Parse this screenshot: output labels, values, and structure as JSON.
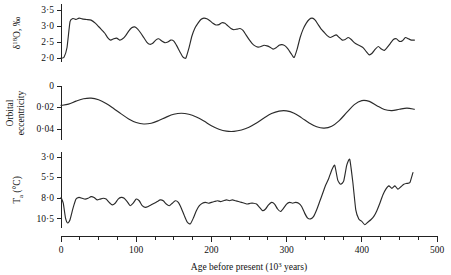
{
  "chart_data": {
    "type": "line",
    "title": "",
    "xlabel": "Age before present (10³ years)",
    "xlim": [
      0,
      500
    ],
    "xticks": [
      0,
      100,
      200,
      300,
      400,
      500
    ],
    "xtick_labels": [
      "0",
      "100",
      "200",
      "300",
      "400",
      "500"
    ],
    "xminor_step": 25,
    "grid": false,
    "legend": "none",
    "panels": [
      {
        "name": "delta-o18",
        "ylabel": "δ¹⁸O, ‰",
        "ylabel_parts": {
          "delta": "δ",
          "sup": "18",
          "rest": "O, ‰"
        },
        "ylim": [
          3.7,
          1.9
        ],
        "inverted": true,
        "yticks": [
          2.0,
          2.5,
          3.0,
          3.5
        ],
        "ytick_labels": [
          "2·0",
          "2·5",
          "3·0",
          "3·5"
        ],
        "x": [
          0,
          4,
          8,
          12,
          16,
          20,
          24,
          28,
          34,
          40,
          46,
          52,
          58,
          62,
          66,
          70,
          74,
          78,
          82,
          86,
          90,
          94,
          98,
          102,
          106,
          110,
          114,
          118,
          122,
          126,
          130,
          134,
          138,
          142,
          146,
          150,
          154,
          158,
          162,
          166,
          170,
          174,
          178,
          182,
          186,
          190,
          194,
          198,
          202,
          206,
          210,
          214,
          218,
          222,
          226,
          230,
          234,
          238,
          242,
          246,
          250,
          254,
          258,
          262,
          266,
          270,
          274,
          278,
          282,
          286,
          290,
          294,
          298,
          302,
          306,
          310,
          314,
          318,
          322,
          326,
          330,
          334,
          338,
          342,
          346,
          350,
          354,
          358,
          362,
          366,
          370,
          374,
          378,
          382,
          386,
          390,
          394,
          398,
          402,
          406,
          410,
          414,
          418,
          422,
          426,
          430,
          434,
          438,
          442,
          446,
          450,
          454,
          458,
          462,
          466,
          470
        ],
        "y": [
          2.02,
          2.05,
          2.35,
          3.15,
          3.25,
          3.22,
          3.26,
          3.24,
          3.22,
          3.2,
          3.1,
          2.95,
          2.8,
          2.66,
          2.58,
          2.62,
          2.64,
          2.58,
          2.62,
          2.72,
          2.86,
          2.96,
          2.99,
          2.92,
          2.8,
          2.66,
          2.52,
          2.45,
          2.48,
          2.58,
          2.62,
          2.55,
          2.5,
          2.52,
          2.58,
          2.55,
          2.4,
          2.22,
          2.06,
          2.02,
          2.32,
          2.7,
          2.95,
          3.1,
          3.22,
          3.26,
          3.24,
          3.18,
          3.1,
          3.05,
          3.06,
          3.12,
          3.1,
          3.02,
          2.94,
          2.9,
          2.92,
          2.94,
          2.88,
          2.74,
          2.6,
          2.48,
          2.4,
          2.36,
          2.38,
          2.42,
          2.4,
          2.36,
          2.3,
          2.34,
          2.42,
          2.44,
          2.4,
          2.3,
          2.16,
          2.04,
          2.3,
          2.66,
          2.92,
          3.1,
          3.22,
          3.26,
          3.2,
          3.06,
          2.92,
          2.82,
          2.72,
          2.66,
          2.7,
          2.74,
          2.66,
          2.58,
          2.6,
          2.66,
          2.6,
          2.5,
          2.44,
          2.4,
          2.34,
          2.22,
          2.12,
          2.18,
          2.3,
          2.38,
          2.3,
          2.26,
          2.36,
          2.48,
          2.6,
          2.62,
          2.54,
          2.56,
          2.66,
          2.62,
          2.58,
          2.58
        ]
      },
      {
        "name": "orbital-eccentricity",
        "ylabel": "Orbital eccentricity",
        "ylim": [
          0,
          0.05
        ],
        "inverted": false,
        "yticks": [
          0,
          0.02,
          0.04
        ],
        "ytick_labels": [
          "0",
          "0·02",
          "0·04"
        ],
        "x": [
          0,
          10,
          20,
          30,
          40,
          50,
          60,
          70,
          80,
          90,
          100,
          110,
          120,
          130,
          140,
          150,
          160,
          170,
          180,
          190,
          200,
          210,
          220,
          230,
          240,
          250,
          260,
          270,
          280,
          290,
          300,
          310,
          320,
          330,
          340,
          350,
          360,
          370,
          380,
          390,
          400,
          410,
          420,
          430,
          440,
          450,
          460,
          470
        ],
        "y": [
          0.018,
          0.0168,
          0.014,
          0.0118,
          0.0112,
          0.0128,
          0.0162,
          0.0208,
          0.0258,
          0.0305,
          0.0338,
          0.0352,
          0.0345,
          0.032,
          0.0288,
          0.0262,
          0.0252,
          0.0262,
          0.0288,
          0.0325,
          0.0368,
          0.04,
          0.0418,
          0.042,
          0.0408,
          0.0382,
          0.0342,
          0.0296,
          0.0255,
          0.0232,
          0.023,
          0.0252,
          0.0295,
          0.0342,
          0.0378,
          0.039,
          0.0372,
          0.032,
          0.0245,
          0.0172,
          0.0135,
          0.0142,
          0.0182,
          0.0218,
          0.0228,
          0.0215,
          0.0205,
          0.0215
        ]
      },
      {
        "name": "air-temperature",
        "ylabel": "Tₐ (°C)",
        "ylabel_parts": {
          "main": "T",
          "sub": "a",
          "rest": " (°C)"
        },
        "ylim": [
          2.4,
          11.6
        ],
        "inverted": false,
        "yticks": [
          3.0,
          5.5,
          8.0,
          10.5
        ],
        "ytick_labels": [
          "3·0",
          "5·5",
          "8·0",
          "10·5"
        ],
        "x": [
          0,
          3,
          6,
          9,
          12,
          16,
          20,
          24,
          28,
          32,
          36,
          40,
          44,
          48,
          52,
          56,
          60,
          64,
          68,
          72,
          76,
          80,
          84,
          88,
          92,
          96,
          100,
          104,
          108,
          112,
          116,
          120,
          124,
          128,
          132,
          136,
          140,
          144,
          148,
          152,
          156,
          160,
          164,
          168,
          172,
          176,
          180,
          184,
          188,
          192,
          196,
          200,
          204,
          208,
          212,
          216,
          220,
          224,
          228,
          232,
          236,
          240,
          244,
          248,
          252,
          256,
          260,
          264,
          268,
          272,
          276,
          280,
          284,
          288,
          292,
          296,
          300,
          304,
          308,
          312,
          316,
          320,
          324,
          328,
          332,
          336,
          340,
          344,
          348,
          352,
          356,
          360,
          364,
          368,
          372,
          376,
          380,
          384,
          388,
          392,
          396,
          400,
          404,
          408,
          412,
          416,
          420,
          424,
          428,
          432,
          436,
          440,
          444,
          448,
          452,
          456,
          460,
          464,
          468
        ],
        "y": [
          7.9,
          8.6,
          10.4,
          11.0,
          10.6,
          9.2,
          8.1,
          7.9,
          8.0,
          8.1,
          8.0,
          7.8,
          7.9,
          8.2,
          8.1,
          8.0,
          8.1,
          8.5,
          8.8,
          8.6,
          8.1,
          7.9,
          8.0,
          8.4,
          8.9,
          8.6,
          8.1,
          8.3,
          8.9,
          9.1,
          9.0,
          8.8,
          8.6,
          8.4,
          8.2,
          8.3,
          8.7,
          8.9,
          8.6,
          8.3,
          8.5,
          9.2,
          10.1,
          10.9,
          11.1,
          10.4,
          9.5,
          8.9,
          8.6,
          8.5,
          8.6,
          8.5,
          8.4,
          8.3,
          8.4,
          8.3,
          8.2,
          8.3,
          8.2,
          8.3,
          8.4,
          8.5,
          8.6,
          8.7,
          8.6,
          8.6,
          8.7,
          9.1,
          9.5,
          9.3,
          8.8,
          8.5,
          8.7,
          9.3,
          9.6,
          9.2,
          8.7,
          8.5,
          8.6,
          8.5,
          8.6,
          9.0,
          9.8,
          10.4,
          10.5,
          10.2,
          9.4,
          8.4,
          7.4,
          6.4,
          5.6,
          4.6,
          4.0,
          5.8,
          6.3,
          5.9,
          4.0,
          3.3,
          6.0,
          9.4,
          10.5,
          10.8,
          11.2,
          10.9,
          10.6,
          10.2,
          9.5,
          8.6,
          7.6,
          6.9,
          6.5,
          6.8,
          6.5,
          6.9,
          6.6,
          6.3,
          6.2,
          6.1,
          4.9
        ]
      }
    ]
  }
}
